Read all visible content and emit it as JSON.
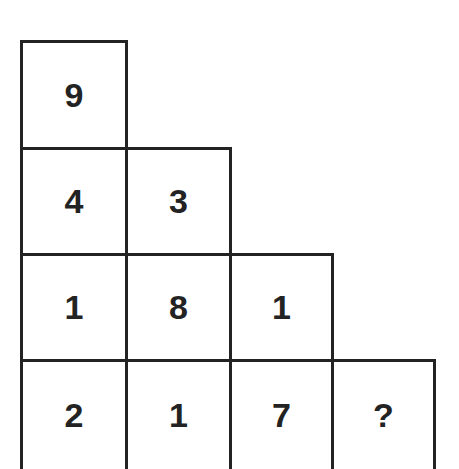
{
  "puzzle": {
    "rows": [
      [
        "9"
      ],
      [
        "4",
        "3"
      ],
      [
        "1",
        "8",
        "1"
      ],
      [
        "2",
        "1",
        "7",
        "?"
      ]
    ]
  }
}
